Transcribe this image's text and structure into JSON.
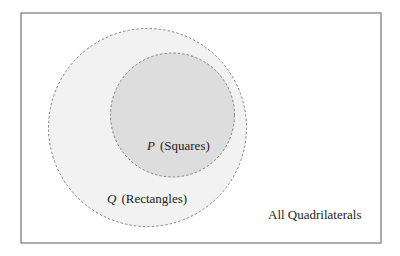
{
  "diagram": {
    "type": "venn",
    "frame": {
      "x": 21,
      "y": 13,
      "width": 360,
      "height": 230,
      "stroke": "#777777"
    },
    "sets": [
      {
        "id": "Q",
        "variable": "Q",
        "name": "(Rectangles)",
        "cx": 147.5,
        "cy": 127.5,
        "r": 99,
        "fill": "#f2f2f2",
        "stroke": "#777777"
      },
      {
        "id": "P",
        "variable": "P",
        "name": "(Squares)",
        "cx": 172.5,
        "cy": 115,
        "r": 62,
        "fill": "#dddddd",
        "stroke": "#777777"
      }
    ],
    "universe_label": "All Quadrilaterals",
    "relation": "P is a subset of Q"
  }
}
